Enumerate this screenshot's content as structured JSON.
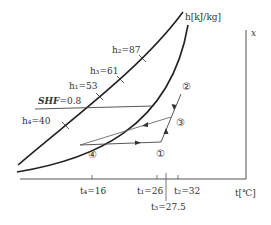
{
  "diagram": {
    "type": "psychrometric-chart-process",
    "axes": {
      "x_label": "t[℃]",
      "y_label": "x",
      "enthalpy_label": "h[kJ/kg]"
    },
    "enthalpy_marks": [
      {
        "label": "h₂=87",
        "value": 87
      },
      {
        "label": "h₃=61",
        "value": 61
      },
      {
        "label": "h₁=53",
        "value": 53
      },
      {
        "label": "h₄=40",
        "value": 40
      }
    ],
    "shf_label": "SHF=0.8",
    "shf_name": "SHF",
    "shf_value": "=0.8",
    "temperature_ticks": [
      {
        "label": "t₄=16",
        "value": 16
      },
      {
        "label": "t₁=26",
        "value": 26
      },
      {
        "label": "t₃=27.5",
        "value": 27.5
      },
      {
        "label": "t₂=32",
        "value": 32
      }
    ],
    "state_points": [
      {
        "label": "①",
        "name": "state-1"
      },
      {
        "label": "②",
        "name": "state-2"
      },
      {
        "label": "③",
        "name": "state-3"
      },
      {
        "label": "④",
        "name": "state-4"
      }
    ]
  }
}
